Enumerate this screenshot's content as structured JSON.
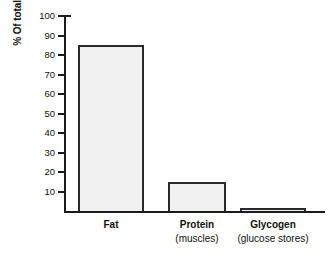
{
  "chart_data": {
    "type": "bar",
    "title": "",
    "xlabel": "",
    "ylabel": "% Of total",
    "ylim": [
      0,
      100
    ],
    "grid": false,
    "legend": false,
    "categories": [
      "Fat",
      "Protein",
      "Glycogen"
    ],
    "category_sublabels": [
      "",
      "(muscles)",
      "(glucose stores)"
    ],
    "values": [
      85,
      15,
      1.5
    ],
    "ytick_labels": [
      "100",
      "90",
      "80",
      "70",
      "60",
      "50",
      "40",
      "30",
      "20",
      "10"
    ],
    "ytick_values": [
      100,
      90,
      80,
      70,
      60,
      50,
      40,
      30,
      20,
      10
    ],
    "bar_fill_color": "#f0f0f0",
    "bar_border_color": "#2a2a2a",
    "axis_color": "#1b1b1b",
    "background_color": "#ffffff"
  },
  "axis": {
    "y_title": "% Of total"
  }
}
